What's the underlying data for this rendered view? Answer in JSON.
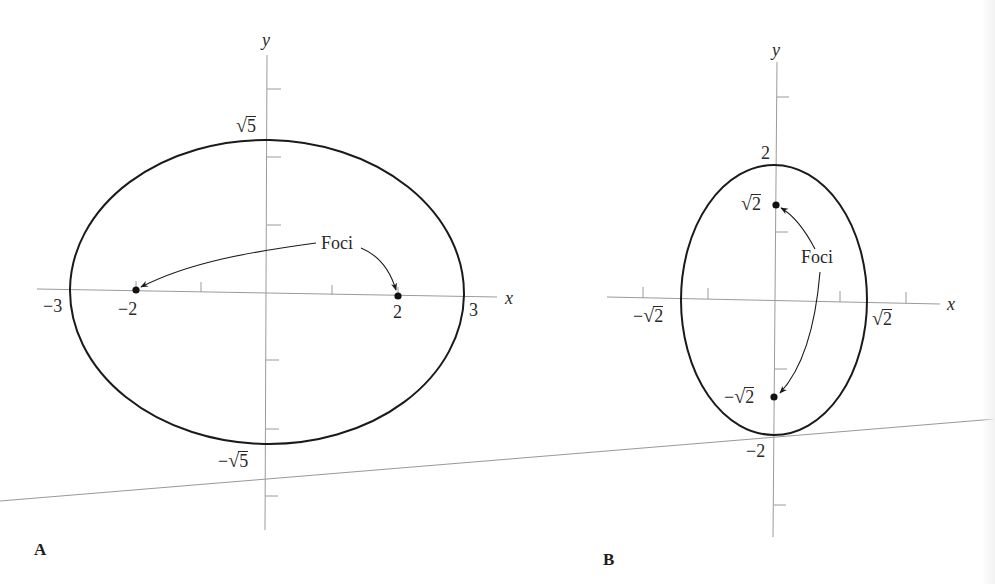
{
  "figures": [
    {
      "id": "A",
      "panel_label": "A",
      "axis_labels": {
        "x": "x",
        "y": "y"
      },
      "ellipse": {
        "a": 3,
        "b": "√5",
        "orientation": "horizontal",
        "equation": "x²/9 + y²/5 = 1"
      },
      "x_tick_labels": {
        "neg_vertex": "−3",
        "neg_focus": "−2",
        "pos_focus": "2",
        "pos_vertex": "3"
      },
      "y_tick_labels": {
        "top": "5",
        "bottom": "5",
        "bottom_sign": "−"
      },
      "foci": [
        [
          -2,
          0
        ],
        [
          2,
          0
        ]
      ],
      "annotation": "Foci"
    },
    {
      "id": "B",
      "panel_label": "B",
      "axis_labels": {
        "x": "x",
        "y": "y"
      },
      "ellipse": {
        "a": 2,
        "b": "√2",
        "orientation": "vertical",
        "equation": "x²/2 + y²/4 = 1"
      },
      "x_tick_labels": {
        "neg_sign": "−",
        "neg": "2",
        "pos": "2"
      },
      "y_tick_labels": {
        "top": "2",
        "focus_top": "2",
        "focus_bottom_sign": "−",
        "focus_bottom": "2",
        "bottom": "−2"
      },
      "foci": [
        [
          0,
          "√2"
        ],
        [
          0,
          "−√2"
        ]
      ],
      "annotation": "Foci"
    }
  ],
  "colors": {
    "curve": "#1a1a1a",
    "axis": "#9a9a9a",
    "text": "#2a2a2a",
    "background": "#ffffff"
  }
}
